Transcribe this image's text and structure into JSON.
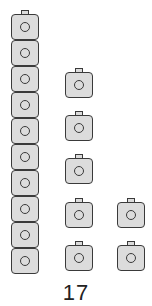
{
  "diagram": {
    "type": "base-ten-blocks",
    "total_label": "17",
    "columns": [
      {
        "name": "ten-rod",
        "cube_count": 10,
        "connected": true
      },
      {
        "name": "ones-column-1",
        "cube_count": 5,
        "connected": false
      },
      {
        "name": "ones-column-2",
        "cube_count": 2,
        "connected": false
      }
    ],
    "colors": {
      "cube_fill": "#dcdcdc",
      "cube_outline": "#3a3a3a"
    }
  }
}
